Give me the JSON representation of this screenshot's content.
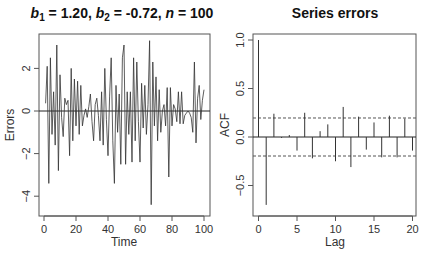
{
  "chart_data": [
    {
      "type": "line",
      "title": "b1 = 1.20, b2 = -0.72,  n = 100",
      "title_parts": {
        "b1_label": "b",
        "b1_sub": "1",
        "b1_val": " = 1.20, ",
        "b2_label": "b",
        "b2_sub": "2",
        "b2_val": " = -0.72,  ",
        "n_label": "n",
        "n_val": " = 100"
      },
      "xlabel": "Time",
      "ylabel": "Errors",
      "xlim": [
        -2,
        103
      ],
      "ylim": [
        -4.95,
        3.6
      ],
      "xticks": [
        0,
        20,
        40,
        60,
        80,
        100
      ],
      "yticks": [
        -4,
        -2,
        0,
        2
      ],
      "hline": 0,
      "series": [
        {
          "name": "errors",
          "x_start": 1,
          "values": [
            0.36,
            2.1,
            -3.4,
            2.5,
            -1.1,
            0.9,
            -1.6,
            3.1,
            -2.8,
            1.7,
            -0.3,
            -1.2,
            0.6,
            0.3,
            0.5,
            -2.1,
            2.0,
            -1.4,
            1.5,
            -0.7,
            1.4,
            -1.1,
            1.2,
            -0.7,
            -0.2,
            0.1,
            -0.3,
            0.2,
            0.8,
            -0.5,
            -1.4,
            0.3,
            0.6,
            -0.2,
            -1.4,
            0.9,
            -1.6,
            2.0,
            -0.4,
            -2.1,
            0.7,
            2.5,
            -1.4,
            -3.4,
            1.2,
            -1.0,
            0.8,
            -2.5,
            2.5,
            3.1,
            -2.5,
            0.9,
            -1.1,
            0.9,
            -2.4,
            2.5,
            -1.4,
            2.3,
            -0.5,
            -2.4,
            1.3,
            -0.8,
            1.2,
            -1.1,
            0.3,
            3.3,
            -4.4,
            2.3,
            -0.7,
            1.6,
            -1.4,
            1.0,
            -1.0,
            0.0,
            0.3,
            -0.7,
            1.1,
            -3.1,
            1.1,
            -0.7,
            0.3,
            0.1,
            -0.5,
            0.9,
            -0.6,
            0.9,
            -0.6,
            -0.2,
            -0.1,
            0.0,
            -0.1,
            -0.3,
            -1.0,
            2.3,
            -1.5,
            0.6,
            1.2,
            -0.4,
            0.5,
            1.0
          ]
        }
      ]
    },
    {
      "type": "bar",
      "title": "Series errors",
      "xlabel": "Lag",
      "ylabel": "ACF",
      "xlim": [
        -0.6,
        20.6
      ],
      "ylim": [
        -0.8,
        1.06
      ],
      "xticks": [
        0,
        5,
        10,
        15,
        20
      ],
      "yticks": [
        -0.5,
        0.0,
        0.5,
        1.0
      ],
      "confidence_bounds": [
        0.196,
        -0.196
      ],
      "categories": [
        0,
        1,
        2,
        3,
        4,
        5,
        6,
        7,
        8,
        9,
        10,
        11,
        12,
        13,
        14,
        15,
        16,
        17,
        18,
        19,
        20
      ],
      "values": [
        1.0,
        -0.7,
        0.24,
        -0.01,
        0.02,
        -0.14,
        0.25,
        -0.22,
        0.06,
        0.13,
        -0.25,
        0.31,
        -0.31,
        0.21,
        -0.13,
        0.15,
        -0.21,
        0.22,
        -0.21,
        0.19,
        -0.14
      ]
    }
  ]
}
